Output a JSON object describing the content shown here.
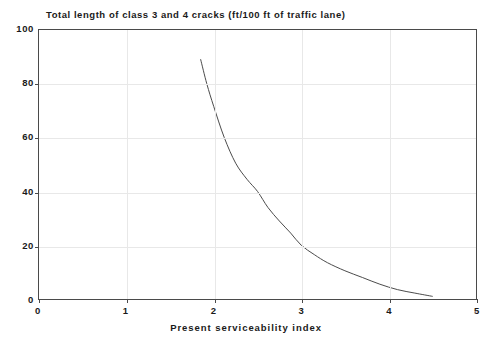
{
  "chart_data": {
    "type": "line",
    "title": "Total length of class 3 and 4 cracks (ft/100 ft of traffic lane)",
    "xlabel": "Present serviceability index",
    "ylabel": "",
    "xlim": [
      0,
      5
    ],
    "ylim": [
      0,
      100
    ],
    "xticks": [
      "0",
      "1",
      "2",
      "3",
      "4",
      "5"
    ],
    "xtick_values": [
      0,
      1,
      2,
      3,
      4,
      5
    ],
    "yticks": [
      "0",
      "20",
      "40",
      "60",
      "80",
      "100"
    ],
    "ytick_values": [
      0,
      20,
      40,
      60,
      80,
      100
    ],
    "grid": true,
    "legend": "none",
    "line_color": "#4a4a4a",
    "frame_color": "#4a4a4a",
    "grid_color": "#e8e8e8",
    "background_color": "#ffffff",
    "series": [
      {
        "name": "Total length of class 3 and 4 cracks",
        "x": [
          1.85,
          1.92,
          2.0,
          2.12,
          2.25,
          2.38,
          2.5,
          2.62,
          2.75,
          2.88,
          3.0,
          3.15,
          3.3,
          3.5,
          3.7,
          3.9,
          4.1,
          4.3,
          4.5
        ],
        "values": [
          89.0,
          80.0,
          71.5,
          60.0,
          50.5,
          44.5,
          40.0,
          34.0,
          29.0,
          24.5,
          20.0,
          16.5,
          13.5,
          10.5,
          8.0,
          5.5,
          3.5,
          2.2,
          1.0
        ]
      }
    ]
  },
  "chart": {
    "title": "Total length of class 3 and 4 cracks (ft/100 ft of traffic lane)",
    "xaxis_title": "Present serviceability index"
  }
}
